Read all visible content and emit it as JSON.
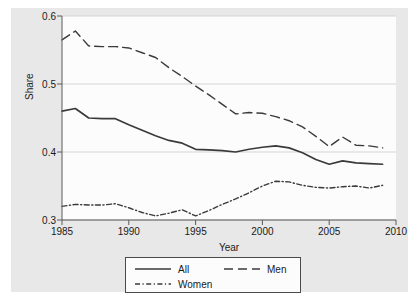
{
  "chart_data": {
    "type": "line",
    "title": "",
    "xlabel": "Year",
    "ylabel": "Share",
    "xlim": [
      1985,
      2010
    ],
    "ylim": [
      0.3,
      0.6
    ],
    "xticks": [
      1985,
      1990,
      1995,
      2000,
      2005,
      2010
    ],
    "yticks": [
      0.3,
      0.4,
      0.5,
      0.6
    ],
    "ytick_labels": [
      "0.3",
      "0.4",
      "0.5",
      "0.6"
    ],
    "xtick_labels": [
      "1985",
      "1990",
      "1995",
      "2000",
      "2005",
      "2010"
    ],
    "grid": "horizontal",
    "legend_position": "below-plot",
    "x": [
      1985,
      1986,
      1987,
      1988,
      1989,
      1990,
      1991,
      1992,
      1993,
      1994,
      1995,
      1996,
      1997,
      1998,
      1999,
      2000,
      2001,
      2002,
      2003,
      2004,
      2005,
      2006,
      2007,
      2008,
      2009
    ],
    "series": [
      {
        "name": "All",
        "style": "solid",
        "color": "#3a3a3a",
        "values": [
          0.46,
          0.464,
          0.45,
          0.449,
          0.449,
          0.44,
          0.432,
          0.424,
          0.417,
          0.413,
          0.404,
          0.403,
          0.402,
          0.4,
          0.404,
          0.407,
          0.409,
          0.406,
          0.399,
          0.389,
          0.382,
          0.387,
          0.384,
          0.383,
          0.382
        ]
      },
      {
        "name": "Men",
        "style": "dashed",
        "color": "#3a3a3a",
        "values": [
          0.565,
          0.578,
          0.556,
          0.555,
          0.555,
          0.553,
          0.546,
          0.539,
          0.524,
          0.511,
          0.497,
          0.484,
          0.47,
          0.456,
          0.458,
          0.457,
          0.452,
          0.446,
          0.437,
          0.423,
          0.408,
          0.422,
          0.41,
          0.409,
          0.406
        ]
      },
      {
        "name": "Women",
        "style": "dashdot",
        "color": "#3a3a3a",
        "values": [
          0.32,
          0.323,
          0.322,
          0.322,
          0.324,
          0.318,
          0.311,
          0.306,
          0.31,
          0.315,
          0.306,
          0.314,
          0.323,
          0.331,
          0.34,
          0.35,
          0.357,
          0.356,
          0.351,
          0.348,
          0.347,
          0.349,
          0.35,
          0.347,
          0.351
        ]
      }
    ],
    "legend": [
      {
        "label": "All",
        "style": "solid"
      },
      {
        "label": "Men",
        "style": "dashed"
      },
      {
        "label": "Women",
        "style": "dashdot"
      }
    ],
    "colors": {
      "figure_background": "#e8e8e8",
      "plot_background": "#fcfcfc",
      "gridline": "#d4d4d4",
      "axis": "#5a5a5a",
      "text": "#1a1a1a",
      "line": "#3a3a3a"
    }
  }
}
